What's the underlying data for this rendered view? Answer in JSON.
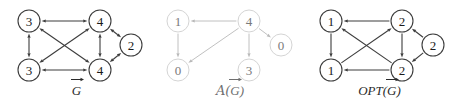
{
  "figure": {
    "background": "#ffffff",
    "panels": [
      {
        "id": "g",
        "caption": "G",
        "caption_prefix": "",
        "caption_full": "G⃗",
        "style": "dark",
        "edge_color": "#3c3c3c",
        "node_stroke": "#3c3c3c",
        "text_color": "#1a1a1a",
        "nodes": [
          {
            "id": "tl",
            "label": "3",
            "cx": 29,
            "cy": 21,
            "r": 11
          },
          {
            "id": "tr",
            "label": "4",
            "cx": 100,
            "cy": 21,
            "r": 11
          },
          {
            "id": "rt",
            "label": "2",
            "cx": 131,
            "cy": 45,
            "r": 11
          },
          {
            "id": "bl",
            "label": "3",
            "cx": 29,
            "cy": 70,
            "r": 11
          },
          {
            "id": "br",
            "label": "4",
            "cx": 100,
            "cy": 70,
            "r": 11
          }
        ],
        "edges": [
          {
            "from": "tl",
            "to": "tr",
            "dir": "both"
          },
          {
            "from": "tl",
            "to": "bl",
            "dir": "both"
          },
          {
            "from": "tl",
            "to": "br",
            "dir": "both"
          },
          {
            "from": "tr",
            "to": "bl",
            "dir": "both"
          },
          {
            "from": "tr",
            "to": "br",
            "dir": "both"
          },
          {
            "from": "tr",
            "to": "rt",
            "dir": "both"
          },
          {
            "from": "bl",
            "to": "br",
            "dir": "both"
          },
          {
            "from": "br",
            "to": "rt",
            "dir": "both"
          }
        ]
      },
      {
        "id": "a",
        "caption": "G",
        "caption_prefix": "A(",
        "caption_suffix": ")",
        "caption_full": "𝒜(G⃗)",
        "style": "light",
        "edge_color": "#b9b9b9",
        "node_stroke": "#cfcfcf",
        "text_color": "#7a7a7a",
        "nodes": [
          {
            "id": "tl",
            "label": "1",
            "cx": 28,
            "cy": 21,
            "r": 11
          },
          {
            "id": "tr",
            "label": "4",
            "cx": 99,
            "cy": 21,
            "r": 11
          },
          {
            "id": "rt",
            "label": "0",
            "cx": 131,
            "cy": 45,
            "r": 11
          },
          {
            "id": "bl",
            "label": "0",
            "cx": 28,
            "cy": 70,
            "r": 11
          },
          {
            "id": "br",
            "label": "3",
            "cx": 99,
            "cy": 70,
            "r": 11
          }
        ],
        "edges": [
          {
            "from": "tr",
            "to": "tl",
            "dir": "to"
          },
          {
            "from": "tl",
            "to": "bl",
            "dir": "to"
          },
          {
            "from": "tr",
            "to": "bl",
            "dir": "to"
          },
          {
            "from": "tr",
            "to": "br",
            "dir": "to"
          },
          {
            "from": "tr",
            "to": "rt",
            "dir": "to"
          }
        ]
      },
      {
        "id": "opt",
        "caption": "G",
        "caption_prefix": "OPT(",
        "caption_suffix": ")",
        "caption_full": "OPT(G⃗)",
        "style": "dark",
        "edge_color": "#3c3c3c",
        "node_stroke": "#3c3c3c",
        "text_color": "#1a1a1a",
        "nodes": [
          {
            "id": "tl",
            "label": "1",
            "cx": 31,
            "cy": 21,
            "r": 11
          },
          {
            "id": "tr",
            "label": "2",
            "cx": 102,
            "cy": 21,
            "r": 11
          },
          {
            "id": "rt",
            "label": "2",
            "cx": 133,
            "cy": 45,
            "r": 11
          },
          {
            "id": "bl",
            "label": "1",
            "cx": 31,
            "cy": 70,
            "r": 11
          },
          {
            "id": "br",
            "label": "2",
            "cx": 102,
            "cy": 70,
            "r": 11
          }
        ],
        "edges": [
          {
            "from": "tr",
            "to": "tl",
            "dir": "to"
          },
          {
            "from": "tl",
            "to": "bl",
            "dir": "to"
          },
          {
            "from": "br",
            "to": "tl",
            "dir": "to"
          },
          {
            "from": "bl",
            "to": "tr",
            "dir": "to"
          },
          {
            "from": "tr",
            "to": "br",
            "dir": "to"
          },
          {
            "from": "rt",
            "to": "tr",
            "dir": "to"
          },
          {
            "from": "br",
            "to": "bl",
            "dir": "to"
          },
          {
            "from": "rt",
            "to": "br",
            "dir": "to"
          }
        ]
      }
    ],
    "captions": {
      "g": "G⃗",
      "a": "𝒜(G⃗)",
      "opt": "OPT(G⃗)"
    }
  }
}
